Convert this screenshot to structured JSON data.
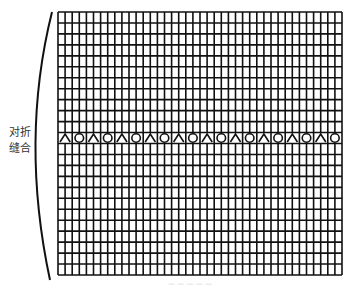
{
  "diagram": {
    "side_label_line1": "对折",
    "side_label_line2": "缝合",
    "grid": {
      "x": 58,
      "y": 12,
      "width": 284,
      "height": 263,
      "columns": 40,
      "rows": 24,
      "pattern_row_index": 11,
      "pattern_sequence": [
        "triangle",
        "circle"
      ],
      "pattern_symbol_width_cells": 2,
      "line_color": "#111111"
    },
    "caption": "— — — — —"
  }
}
